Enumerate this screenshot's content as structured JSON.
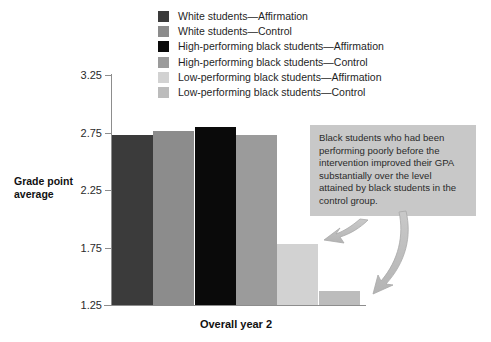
{
  "chart_data": {
    "type": "bar",
    "title": "",
    "subtitle": "",
    "xlabel": "Overall year 2",
    "ylabel": "Grade point average",
    "categories": [
      "Overall year 2"
    ],
    "ylim": [
      1.25,
      3.25
    ],
    "ytick_labels": [
      "3.25",
      "2.75",
      "2.25",
      "1.75",
      "1.25"
    ],
    "yticks": [
      3.25,
      2.75,
      2.25,
      1.75,
      1.25
    ],
    "grid": false,
    "legend_position": "top-center",
    "series": [
      {
        "name": "White students—Affirmation",
        "values": [
          2.73
        ],
        "color": "#3b3b3b"
      },
      {
        "name": "White students—Control",
        "values": [
          2.76
        ],
        "color": "#8c8c8c"
      },
      {
        "name": "High-performing black students—Affirmation",
        "values": [
          2.8
        ],
        "color": "#0a0a0a"
      },
      {
        "name": "High-performing black students—Control",
        "values": [
          2.73
        ],
        "color": "#9b9b9b"
      },
      {
        "name": "Low-performing black students—Affirmation",
        "values": [
          1.78
        ],
        "color": "#d2d2d2"
      },
      {
        "name": "Low-performing black students—Control",
        "values": [
          1.37
        ],
        "color": "#bcbcbc"
      }
    ],
    "annotations": [
      {
        "text": "Black students who had been performing poorly before the intervention improved their GPA substantially over the level attained by black students in the control group.",
        "background": "#c8c8c8",
        "points_to": [
          "Low-performing black students—Affirmation",
          "Low-performing black students—Control"
        ]
      }
    ]
  },
  "legend": {
    "items": [
      {
        "label": "White students—Affirmation",
        "color": "#3b3b3b"
      },
      {
        "label": "White students—Control",
        "color": "#8c8c8c"
      },
      {
        "label": "High-performing black students—Affirmation",
        "color": "#0a0a0a"
      },
      {
        "label": "High-performing black students—Control",
        "color": "#9b9b9b"
      },
      {
        "label": "Low-performing black students—Affirmation",
        "color": "#d2d2d2"
      },
      {
        "label": "Low-performing black students—Control",
        "color": "#bcbcbc"
      }
    ]
  },
  "axes": {
    "y_title_line1": "Grade point",
    "y_title_line2": "average",
    "x_title": "Overall year 2",
    "y_ticks": [
      {
        "label": "3.25",
        "value": 3.25
      },
      {
        "label": "2.75",
        "value": 2.75
      },
      {
        "label": "2.25",
        "value": 2.25
      },
      {
        "label": "1.75",
        "value": 1.75
      },
      {
        "label": "1.25",
        "value": 1.25
      }
    ]
  },
  "annotation": {
    "text": "Black students who had been performing poorly before the intervention improved their GPA substantially over the level attained by black students in the control group."
  }
}
